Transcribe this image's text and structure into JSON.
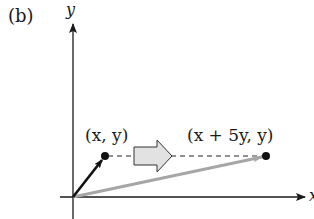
{
  "figure": {
    "panel_label": "(b)",
    "y_axis_label": "y",
    "x_axis_label": "x",
    "point_original_label": "(x, y)",
    "point_image_label": "(x + 5y, y)",
    "transformation": "horizontal shear (x, y) -> (x + 5y, y)",
    "colors": {
      "axes": "#1a1a1a",
      "original_vector": "#111111",
      "image_vector": "#a6a6a6",
      "block_arrow_fill": "#e2e2e2",
      "block_arrow_stroke": "#333333"
    }
  }
}
